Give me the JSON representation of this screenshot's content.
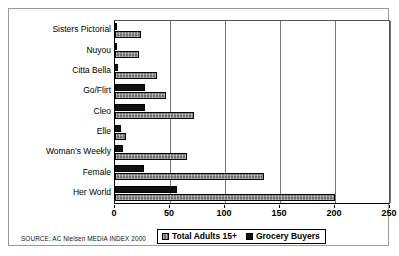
{
  "chart_data": {
    "type": "bar",
    "orientation": "horizontal",
    "title": "",
    "xlabel": "",
    "ylabel": "",
    "xlim": [
      0,
      250
    ],
    "xticks": [
      0,
      50,
      100,
      150,
      200,
      250
    ],
    "grid": true,
    "legend_position": "bottom",
    "categories": [
      "Sisters Pictorial",
      "Nuyou",
      "Citta Bella",
      "Go/Flirt",
      "Cleo",
      "Elle",
      "Woman's Weekly",
      "Female",
      "Her World"
    ],
    "series": [
      {
        "name": "Total Adults 15+",
        "color": "#6f6f6f",
        "values": [
          24,
          22,
          38,
          46,
          72,
          10,
          65,
          135,
          200
        ]
      },
      {
        "name": "Grocery Buyers",
        "color": "#111111",
        "values": [
          2,
          1,
          3,
          27,
          27,
          5,
          7,
          26,
          56
        ]
      }
    ],
    "source": "SOURCE: AC Nielsen MEDIA INDEX 2000"
  },
  "legend": {
    "items": [
      {
        "label": "Total Adults 15+",
        "swatch": "adults"
      },
      {
        "label": "Grocery Buyers",
        "swatch": "grocery"
      }
    ]
  }
}
